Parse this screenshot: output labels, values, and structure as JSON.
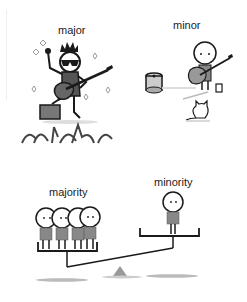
{
  "panels": {
    "major": {
      "label": "major"
    },
    "minor": {
      "label": "minor"
    },
    "majority": {
      "label": "majority"
    },
    "minority": {
      "label": "minority"
    }
  },
  "colors": {
    "ink": "#1a1a1a",
    "body_gray": "#8a8a8a",
    "shadow_gray": "#c8c8c8",
    "amp_gray": "#777777",
    "fulcrum_gray": "#999999"
  }
}
